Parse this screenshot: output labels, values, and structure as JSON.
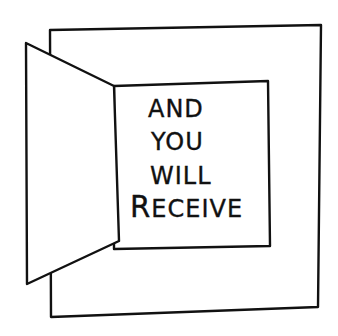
{
  "illustration": {
    "description": "Hand-drawn open door revealing a card with a message",
    "ink_color": "#111111",
    "background_color": "#ffffff",
    "outer_frame": {
      "points": [
        [
          50,
          30
        ],
        [
          321,
          25
        ],
        [
          318,
          307
        ],
        [
          51,
          317
        ]
      ]
    },
    "inner_panel": {
      "points": [
        [
          114,
          86
        ],
        [
          268,
          81
        ],
        [
          270,
          246
        ],
        [
          114,
          249
        ]
      ]
    },
    "door": {
      "points": [
        [
          26,
          43
        ],
        [
          114,
          86
        ],
        [
          119,
          241
        ],
        [
          27,
          284
        ]
      ]
    },
    "message": {
      "lines": [
        {
          "text": "AND",
          "x": 148,
          "y": 97,
          "size": 24
        },
        {
          "text": "YOU",
          "x": 151,
          "y": 130,
          "size": 24
        },
        {
          "text": "WILL",
          "x": 150,
          "y": 164,
          "size": 24
        },
        {
          "text_initial": "R",
          "text_rest": "ECEIVE",
          "x": 130,
          "y": 193,
          "size": 24
        }
      ]
    }
  }
}
